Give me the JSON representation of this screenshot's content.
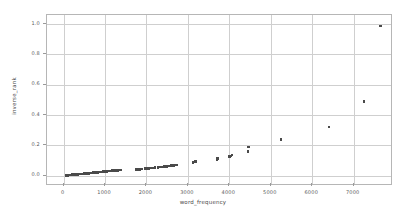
{
  "chart_data": {
    "type": "scatter",
    "title": "",
    "xlabel": "word_frequency",
    "ylabel": "inverse_rank",
    "xlim": [
      -400,
      7900
    ],
    "ylim": [
      -0.055,
      1.06
    ],
    "xticks": [
      0,
      1000,
      2000,
      3000,
      4000,
      5000,
      6000,
      7000
    ],
    "xtick_labels": [
      "0",
      "1000",
      "2000",
      "3000",
      "4000",
      "5000",
      "6000",
      "7000"
    ],
    "yticks": [
      0.0,
      0.2,
      0.4,
      0.6,
      0.8,
      1.0
    ],
    "ytick_labels": [
      "0.0",
      "0.2",
      "0.4",
      "0.6",
      "0.8",
      "1.0"
    ],
    "grid": true,
    "legend": null,
    "marker_color": "#4a4a4a",
    "grid_color": "#cfcfcf",
    "frame_color": "#b6b6b6",
    "background": "#ffffff",
    "series": [
      {
        "name": "words",
        "points": [
          [
            60,
            0.002
          ],
          [
            85,
            0.003
          ],
          [
            105,
            0.003
          ],
          [
            125,
            0.004
          ],
          [
            150,
            0.004
          ],
          [
            170,
            0.005
          ],
          [
            190,
            0.005
          ],
          [
            210,
            0.006
          ],
          [
            230,
            0.006
          ],
          [
            250,
            0.007
          ],
          [
            270,
            0.007
          ],
          [
            290,
            0.008
          ],
          [
            310,
            0.008
          ],
          [
            330,
            0.009
          ],
          [
            350,
            0.009
          ],
          [
            370,
            0.01
          ],
          [
            390,
            0.01
          ],
          [
            410,
            0.011
          ],
          [
            430,
            0.011
          ],
          [
            450,
            0.012
          ],
          [
            470,
            0.012
          ],
          [
            490,
            0.013
          ],
          [
            510,
            0.013
          ],
          [
            530,
            0.014
          ],
          [
            550,
            0.014
          ],
          [
            570,
            0.015
          ],
          [
            590,
            0.015
          ],
          [
            610,
            0.016
          ],
          [
            630,
            0.017
          ],
          [
            650,
            0.017
          ],
          [
            670,
            0.018
          ],
          [
            690,
            0.018
          ],
          [
            710,
            0.019
          ],
          [
            730,
            0.019
          ],
          [
            750,
            0.02
          ],
          [
            770,
            0.021
          ],
          [
            790,
            0.021
          ],
          [
            810,
            0.022
          ],
          [
            830,
            0.022
          ],
          [
            850,
            0.023
          ],
          [
            870,
            0.024
          ],
          [
            890,
            0.024
          ],
          [
            910,
            0.025
          ],
          [
            930,
            0.025
          ],
          [
            950,
            0.026
          ],
          [
            970,
            0.027
          ],
          [
            990,
            0.027
          ],
          [
            1010,
            0.028
          ],
          [
            1030,
            0.028
          ],
          [
            1050,
            0.029
          ],
          [
            1070,
            0.03
          ],
          [
            1090,
            0.03
          ],
          [
            1110,
            0.031
          ],
          [
            1130,
            0.031
          ],
          [
            1150,
            0.032
          ],
          [
            1180,
            0.033
          ],
          [
            1210,
            0.034
          ],
          [
            1240,
            0.034
          ],
          [
            1270,
            0.035
          ],
          [
            1300,
            0.036
          ],
          [
            1330,
            0.037
          ],
          [
            1360,
            0.037
          ],
          [
            1390,
            0.038
          ],
          [
            1760,
            0.04
          ],
          [
            1800,
            0.041
          ],
          [
            1840,
            0.042
          ],
          [
            1880,
            0.043
          ],
          [
            1960,
            0.046
          ],
          [
            2000,
            0.047
          ],
          [
            2050,
            0.048
          ],
          [
            2120,
            0.05
          ],
          [
            2160,
            0.051
          ],
          [
            2210,
            0.053
          ],
          [
            2280,
            0.055
          ],
          [
            2320,
            0.056
          ],
          [
            2360,
            0.057
          ],
          [
            2400,
            0.058
          ],
          [
            2440,
            0.06
          ],
          [
            2480,
            0.062
          ],
          [
            2520,
            0.063
          ],
          [
            2560,
            0.064
          ],
          [
            2600,
            0.066
          ],
          [
            2650,
            0.068
          ],
          [
            2700,
            0.07
          ],
          [
            2740,
            0.071
          ],
          [
            3120,
            0.086
          ],
          [
            3150,
            0.09
          ],
          [
            3180,
            0.093
          ],
          [
            3700,
            0.108
          ],
          [
            3720,
            0.112
          ],
          [
            4000,
            0.126
          ],
          [
            4030,
            0.131
          ],
          [
            4060,
            0.136
          ],
          [
            4450,
            0.16
          ],
          [
            4460,
            0.19
          ],
          [
            5250,
            0.24
          ],
          [
            6400,
            0.32
          ],
          [
            7250,
            0.488
          ],
          [
            7640,
            0.988
          ]
        ]
      }
    ]
  }
}
